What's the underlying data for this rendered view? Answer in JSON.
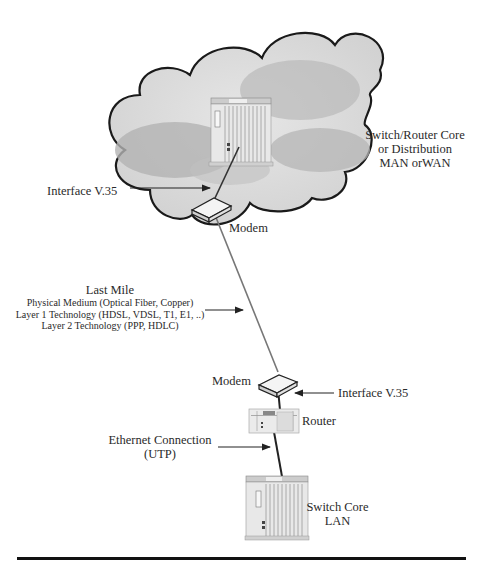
{
  "diagram": {
    "cloud": {
      "label_lines": [
        "Switch/Router Core",
        "or Distribution",
        "MAN orWAN"
      ]
    },
    "nodes": [
      {
        "id": "core",
        "type": "switch-chassis",
        "label": ""
      },
      {
        "id": "modem_top",
        "type": "modem",
        "label": "Modem"
      },
      {
        "id": "modem_bottom",
        "type": "modem",
        "label": "Modem"
      },
      {
        "id": "router",
        "type": "router",
        "label": "Router"
      },
      {
        "id": "switch_lan",
        "type": "switch-chassis",
        "label_lines": [
          "Switch Core",
          "LAN"
        ]
      }
    ],
    "edges": [
      {
        "from": "core",
        "to": "modem_top",
        "annotation": "Interface V.35"
      },
      {
        "from": "modem_top",
        "to": "modem_bottom",
        "annotation": "Last Mile"
      },
      {
        "from": "modem_bottom",
        "to": "router",
        "annotation": "Interface V.35"
      },
      {
        "from": "router",
        "to": "switch_lan",
        "annotation": "Ethernet Connection (UTP)"
      }
    ],
    "annotations": {
      "interface_top": "Interface V.35",
      "interface_bottom": "Interface V.35",
      "last_mile": {
        "title": "Last Mile",
        "lines": [
          "Physical Medium (Optical Fiber, Copper)",
          "Layer 1 Technology (HDSL, VDSL, T1, E1, ..)",
          "Layer 2 Technology (PPP, HDLC)"
        ]
      },
      "ethernet": [
        "Ethernet Connection",
        "(UTP)"
      ]
    },
    "labels": {
      "modem_top": "Modem",
      "modem_bottom": "Modem",
      "router": "Router",
      "switch_lan": [
        "Switch Core",
        "LAN"
      ]
    }
  }
}
